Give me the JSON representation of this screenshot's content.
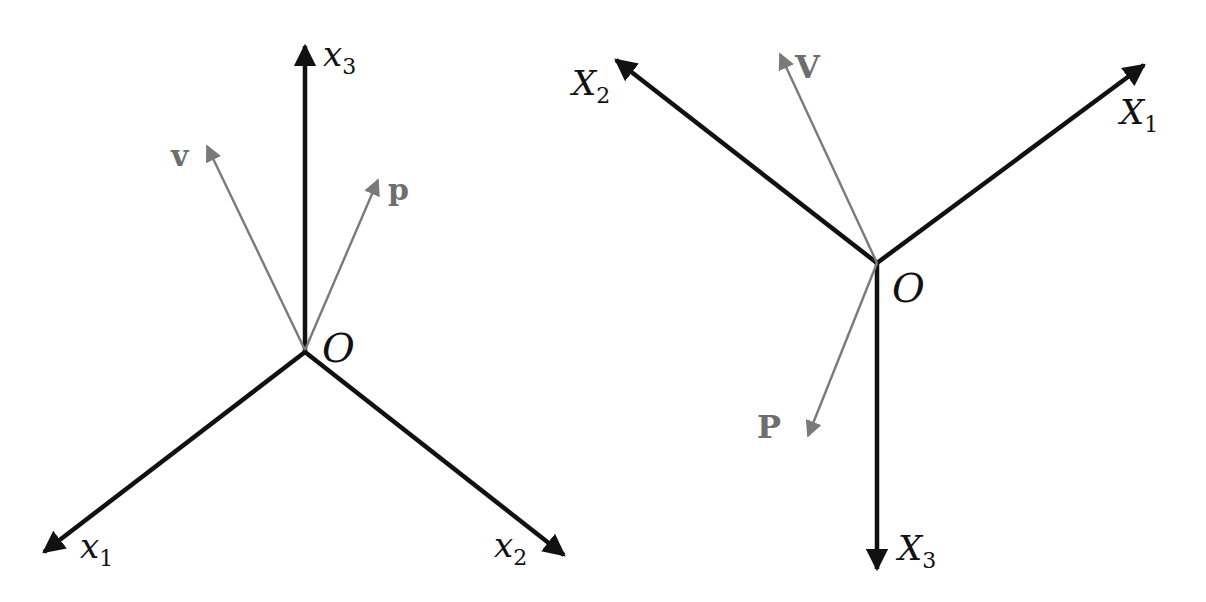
{
  "colors": {
    "axis": "#111111",
    "vector": "#7a7a7a",
    "label_vector": "#6e6e6e",
    "background": "#ffffff"
  },
  "diagrams": [
    {
      "id": "spatial-frame",
      "origin_label": "O",
      "axes": [
        {
          "name": "x1",
          "label_base": "x",
          "label_sub": "1"
        },
        {
          "name": "x2",
          "label_base": "x",
          "label_sub": "2"
        },
        {
          "name": "x3",
          "label_base": "x",
          "label_sub": "3"
        }
      ],
      "vectors": [
        {
          "name": "v",
          "label": "v"
        },
        {
          "name": "p",
          "label": "p"
        }
      ]
    },
    {
      "id": "body-frame",
      "origin_label": "O",
      "axes": [
        {
          "name": "X1",
          "label_base": "X",
          "label_sub": "1"
        },
        {
          "name": "X2",
          "label_base": "X",
          "label_sub": "2"
        },
        {
          "name": "X3",
          "label_base": "X",
          "label_sub": "3"
        }
      ],
      "vectors": [
        {
          "name": "V",
          "label": "V"
        },
        {
          "name": "P",
          "label": "P"
        }
      ]
    }
  ]
}
